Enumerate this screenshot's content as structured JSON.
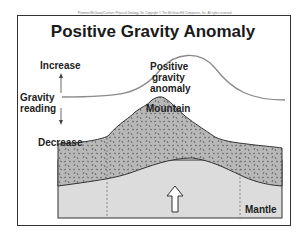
{
  "copyright": "Plummer/McGeary/Carlson: Physical Geology, 9e. Copyright © The McGraw-Hill Companies, Inc. All rights reserved.",
  "title": "Positive Gravity Anomaly",
  "axis": {
    "increase": "Increase",
    "reading_line1": "Gravity",
    "reading_line2": "reading",
    "decrease": "Decrease"
  },
  "curve_label": {
    "line1": "Positive",
    "line2": "gravity",
    "line3": "anomaly"
  },
  "labels": {
    "mountain": "Mountain",
    "mantle": "Mantle"
  },
  "colors": {
    "crust": "#b8b8b8",
    "mantle": "#dcdcdc",
    "curve": "#8a8a8a",
    "outline": "#333333"
  }
}
